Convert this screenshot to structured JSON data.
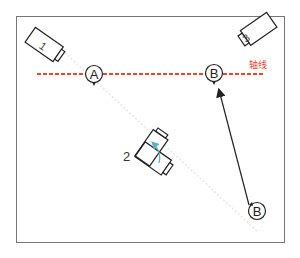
{
  "diagram": {
    "axis_label": "轴线",
    "colors": {
      "axis_line": "#e8472a",
      "axis_label": "#e8472a",
      "frame": "#777777",
      "stroke": "#222222",
      "rotation_arrow": "#5ab4cc",
      "sightline": "#e6e6e6"
    },
    "cameras": [
      {
        "id": "camera-1",
        "label": "1"
      },
      {
        "id": "camera-2",
        "label": "2"
      },
      {
        "id": "camera-3",
        "label": "3"
      }
    ],
    "subjects": [
      {
        "id": "subject-a",
        "label": "A"
      },
      {
        "id": "subject-b-top",
        "label": "B"
      },
      {
        "id": "subject-b-bottom",
        "label": "B"
      }
    ]
  }
}
